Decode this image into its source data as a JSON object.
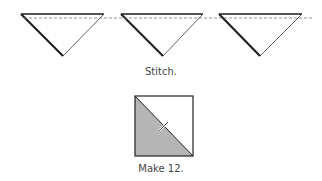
{
  "steps": [
    {
      "caption": "Stitch.",
      "triangle_count": 3,
      "seam": "dashed-line"
    },
    {
      "caption": "Make 12.",
      "unit": "half-square triangle",
      "fill_color": "#b5b5b5"
    }
  ],
  "colors": {
    "line": "#333333",
    "shade": "#b5b5b5",
    "dash": "#777777"
  }
}
